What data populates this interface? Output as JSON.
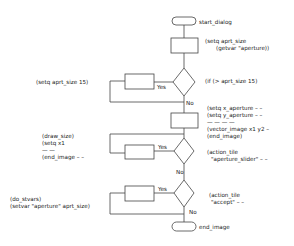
{
  "diagram": {
    "type": "flowchart",
    "terminators": {
      "start": "start_dialog",
      "end": "end_image"
    },
    "branch_labels": {
      "yes": "Yes",
      "no": "No"
    },
    "annotations": {
      "box1_line1": "(setq aprt_size",
      "box1_line2": "(getvar \"aperture))",
      "decision1": "(if (> aprt_size 15)",
      "yes1": "(setq aprt_size 15)",
      "box2_line1": "(setq x_aperture – –",
      "box2_line2": "(setq y_aperture – –",
      "box2_line3": "—  —  —  —",
      "box2_line4": "(vector_image x1 y2 –",
      "box2_line5": "(end_image)",
      "decision2_line1": "(action_tile",
      "decision2_line2": "\"aperture_slider\" – –",
      "yes2_line1": "(draw_size)",
      "yes2_line2": "(setq x1",
      "yes2_line3": "—  —",
      "yes2_line4": "(end_image –  –",
      "decision3_line1": "(action_tile",
      "decision3_line2": "\"accept\" – –",
      "yes3_line1": "(do_stvars)",
      "yes3_line2": "(setvar \"aperture\" aprt_size)"
    },
    "colors": {
      "stroke": "#444444",
      "text": "#222222",
      "background": "#ffffff"
    }
  }
}
